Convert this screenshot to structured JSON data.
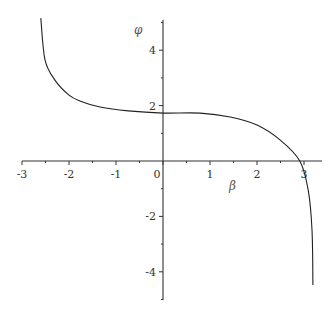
{
  "chart_data": {
    "type": "line",
    "title": "",
    "xlabel": "β",
    "ylabel": "φ",
    "xlim": [
      -3,
      3.3
    ],
    "ylim": [
      -5,
      5.2
    ],
    "grid": false,
    "legend": null,
    "x_ticks": [
      -3,
      -2,
      -1,
      0,
      1,
      2,
      3
    ],
    "x_tick_labels": [
      "-3",
      "-2",
      "-1",
      "0",
      "1",
      "2",
      "3"
    ],
    "y_ticks": [
      4,
      2,
      -2,
      -4
    ],
    "y_tick_labels": [
      "4",
      "2",
      "-2",
      "-4"
    ],
    "series": [
      {
        "name": "φ(β)",
        "color": "#222222",
        "x": [
          -2.6,
          -2.51,
          -2.3,
          -2.0,
          -1.77,
          -1.34,
          -0.74,
          0.0,
          0.79,
          1.43,
          2.0,
          2.49,
          2.91,
          3.09,
          3.17,
          3.19
        ],
        "y": [
          5.16,
          3.65,
          2.92,
          2.38,
          2.17,
          1.95,
          1.81,
          1.73,
          1.73,
          1.59,
          1.3,
          0.76,
          0.0,
          -1.05,
          -2.49,
          -4.48
        ]
      }
    ]
  },
  "layout": {
    "origin_px": [
      163,
      161
    ],
    "px_per_x": 47,
    "px_per_y": 27.7,
    "x_axis_px": [
      22,
      322
    ],
    "y_axis_px": [
      20,
      300
    ]
  }
}
